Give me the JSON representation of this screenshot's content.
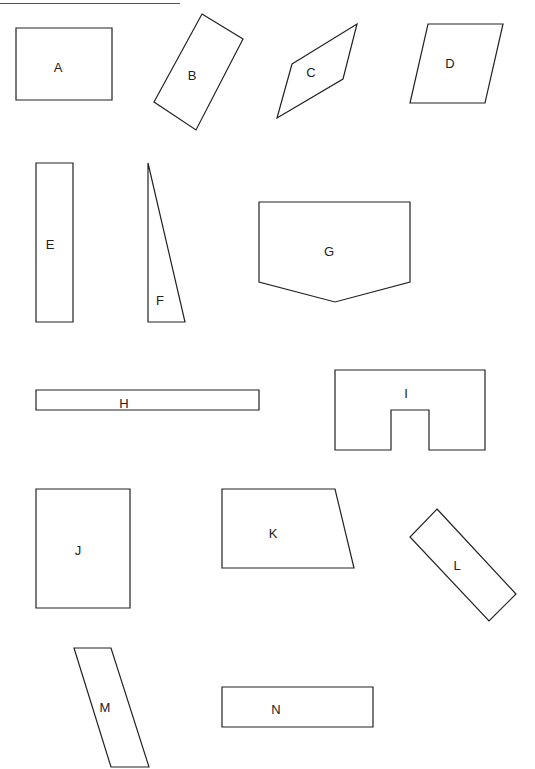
{
  "header": {
    "text": ""
  },
  "shapes": [
    {
      "label": "A",
      "type": "rectangle",
      "points": [
        [
          16,
          28
        ],
        [
          112,
          28
        ],
        [
          112,
          100
        ],
        [
          16,
          100
        ]
      ],
      "label_pos": [
        58,
        72
      ]
    },
    {
      "label": "B",
      "type": "rotated-rectangle",
      "points": [
        [
          202,
          14
        ],
        [
          243,
          39
        ],
        [
          196,
          130
        ],
        [
          154,
          102
        ]
      ],
      "label_pos": [
        192,
        80
      ]
    },
    {
      "label": "C",
      "type": "parallelogram",
      "points": [
        [
          292,
          64
        ],
        [
          357,
          24
        ],
        [
          343,
          79
        ],
        [
          277,
          118
        ]
      ],
      "label_pos": [
        311,
        77
      ]
    },
    {
      "label": "D",
      "type": "parallelogram",
      "points": [
        [
          428,
          24
        ],
        [
          503,
          24
        ],
        [
          485,
          103
        ],
        [
          410,
          103
        ]
      ],
      "label_pos": [
        450,
        68
      ]
    },
    {
      "label": "E",
      "type": "rectangle",
      "points": [
        [
          36,
          163
        ],
        [
          73,
          163
        ],
        [
          73,
          322
        ],
        [
          36,
          322
        ]
      ],
      "label_pos": [
        50,
        249
      ]
    },
    {
      "label": "F",
      "type": "right-triangle",
      "points": [
        [
          148,
          163
        ],
        [
          185,
          322
        ],
        [
          148,
          322
        ]
      ],
      "label_pos": [
        160,
        305
      ]
    },
    {
      "label": "G",
      "type": "pentagon",
      "points": [
        [
          259,
          202
        ],
        [
          410,
          202
        ],
        [
          410,
          282
        ],
        [
          335,
          302
        ],
        [
          259,
          282
        ]
      ],
      "label_pos": [
        329,
        256
      ]
    },
    {
      "label": "H",
      "type": "rectangle",
      "points": [
        [
          36,
          390
        ],
        [
          259,
          390
        ],
        [
          259,
          410
        ],
        [
          36,
          410
        ]
      ],
      "label_pos": [
        124,
        408
      ]
    },
    {
      "label": "I",
      "type": "notched-rectangle",
      "points": [
        [
          335,
          370
        ],
        [
          485,
          370
        ],
        [
          485,
          450
        ],
        [
          429,
          450
        ],
        [
          429,
          410
        ],
        [
          391,
          410
        ],
        [
          391,
          450
        ],
        [
          335,
          450
        ]
      ],
      "label_pos": [
        406,
        398
      ]
    },
    {
      "label": "J",
      "type": "rectangle",
      "points": [
        [
          36,
          489
        ],
        [
          130,
          489
        ],
        [
          130,
          608
        ],
        [
          36,
          608
        ]
      ],
      "label_pos": [
        78,
        555
      ]
    },
    {
      "label": "K",
      "type": "trapezoid",
      "points": [
        [
          222,
          489
        ],
        [
          335,
          489
        ],
        [
          354,
          568
        ],
        [
          222,
          568
        ]
      ],
      "label_pos": [
        273,
        538
      ]
    },
    {
      "label": "L",
      "type": "rotated-rectangle",
      "points": [
        [
          437,
          509
        ],
        [
          516,
          594
        ],
        [
          489,
          621
        ],
        [
          410,
          537
        ]
      ],
      "label_pos": [
        457,
        570
      ]
    },
    {
      "label": "M",
      "type": "parallelogram",
      "points": [
        [
          74,
          648
        ],
        [
          111,
          648
        ],
        [
          149,
          767
        ],
        [
          111,
          767
        ]
      ],
      "label_pos": [
        105,
        712
      ]
    },
    {
      "label": "N",
      "type": "rectangle",
      "points": [
        [
          222,
          687
        ],
        [
          373,
          687
        ],
        [
          373,
          727
        ],
        [
          222,
          727
        ]
      ],
      "label_pos": [
        276,
        714
      ]
    }
  ],
  "colors": {
    "stroke": "#222222",
    "background": "#ffffff",
    "header_rule": "#555555"
  }
}
